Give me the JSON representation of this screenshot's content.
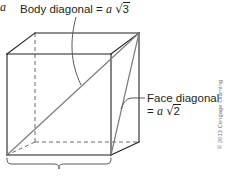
{
  "figure": {
    "shape": "cube",
    "labels": {
      "body_diagonal": {
        "text": "Body diagonal = a √3",
        "prefix": "Body diagonal = ",
        "variable": "a",
        "radical": "√",
        "radicand": "3"
      },
      "face_diagonal": {
        "text": "Face diagonal = a √2",
        "line1": "Face diagonal",
        "equals": "= ",
        "variable": "a",
        "radical": "√",
        "radicand": "2"
      },
      "edge": {
        "text": "a",
        "description": "edge length label under brace"
      }
    },
    "copyright": "© 2013 Cengage Learning",
    "colors": {
      "line_solid": "#231f20",
      "line_hidden": "#58595b",
      "line_diagonal": "#6d6e71",
      "leader": "#58595b",
      "brace": "#58595b",
      "text": "#231f20",
      "copyright_text": "#6d6e71",
      "background": "#ffffff"
    },
    "geometry": {
      "front_top_left": [
        7,
        54
      ],
      "front_top_right": [
        111,
        54
      ],
      "front_bottom_left": [
        7,
        155
      ],
      "front_bottom_right": [
        111,
        155
      ],
      "back_top_left": [
        35,
        33
      ],
      "back_top_right": [
        139,
        33
      ],
      "back_bottom_left": [
        35,
        142
      ],
      "back_bottom_right": [
        139,
        142
      ],
      "body_diagonal_from": [
        7,
        155
      ],
      "body_diagonal_to": [
        139,
        33
      ],
      "face_diagonal_from": [
        111,
        155
      ],
      "face_diagonal_to": [
        139,
        33
      ],
      "brace_span_x": [
        7,
        111
      ],
      "brace_y": 161
    }
  }
}
